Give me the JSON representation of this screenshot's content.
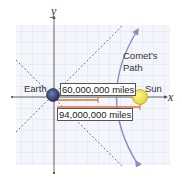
{
  "diagram": {
    "axes": {
      "x_label": "x",
      "y_label": "y"
    },
    "bodies": {
      "earth": {
        "label": "Earth",
        "color": "#3b4a7a"
      },
      "sun": {
        "label": "Sun",
        "color": "#f2e24a"
      }
    },
    "comet": {
      "label_line1": "Comet's",
      "label_line2": "Path",
      "color": "#8a8fbd"
    },
    "distances": {
      "short": "60,000,000 miles",
      "long": "94,000,000 miles",
      "line_color": "#d9733a"
    },
    "grid_color": "#d6dcee",
    "asymptote_color": "#777777"
  }
}
